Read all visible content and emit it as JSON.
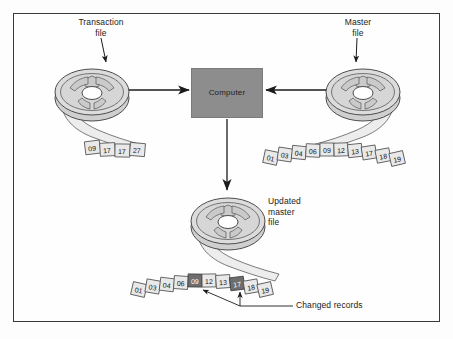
{
  "diagram": {
    "labels": {
      "transaction_file": "Transaction\nfile",
      "master_file": "Master\nfile",
      "updated_master_file": "Updated\nmaster\nfile",
      "computer": "Computer",
      "changed_records": "Changed records"
    },
    "colors": {
      "frame_border": "#3a3a3a",
      "computer_fill": "#8d8d8d",
      "reel_fill": "#d8d8d8",
      "tape_fill": "#ededed",
      "cell_normal_fill": "#e9e9e9",
      "cell_highlight_fill": "#6e6e6e",
      "ink": "#1b1b1b",
      "page_background": "#fdfdfd"
    }
  },
  "tapes": {
    "transaction_file": {
      "name": "transaction-file-tape",
      "records": [
        {
          "value": "09",
          "changed": false
        },
        {
          "value": "17",
          "changed": false
        },
        {
          "value": "17",
          "changed": false
        },
        {
          "value": "27",
          "changed": false
        }
      ]
    },
    "master_file": {
      "name": "master-file-tape",
      "records": [
        {
          "value": "01",
          "changed": false
        },
        {
          "value": "03",
          "changed": false
        },
        {
          "value": "04",
          "changed": false
        },
        {
          "value": "06",
          "changed": false
        },
        {
          "value": "09",
          "changed": false
        },
        {
          "value": "12",
          "changed": false
        },
        {
          "value": "13",
          "changed": false
        },
        {
          "value": "17",
          "changed": false
        },
        {
          "value": "18",
          "changed": false
        },
        {
          "value": "19",
          "changed": false
        }
      ]
    },
    "updated_master_file": {
      "name": "updated-master-file-tape",
      "records": [
        {
          "value": "01",
          "changed": false
        },
        {
          "value": "03",
          "changed": false
        },
        {
          "value": "04",
          "changed": false
        },
        {
          "value": "06",
          "changed": false
        },
        {
          "value": "09",
          "changed": true
        },
        {
          "value": "12",
          "changed": false
        },
        {
          "value": "13",
          "changed": false
        },
        {
          "value": "17",
          "changed": true
        },
        {
          "value": "18",
          "changed": false
        },
        {
          "value": "19",
          "changed": false
        }
      ]
    }
  },
  "flow": {
    "arrows": [
      {
        "name": "transaction-to-computer-arrow",
        "direction": "right"
      },
      {
        "name": "master-to-computer-arrow",
        "direction": "left"
      },
      {
        "name": "computer-to-updated-master-arrow",
        "direction": "down"
      },
      {
        "name": "transaction-file-callout-arrow",
        "direction": "down"
      },
      {
        "name": "master-file-callout-arrow",
        "direction": "down"
      }
    ]
  }
}
